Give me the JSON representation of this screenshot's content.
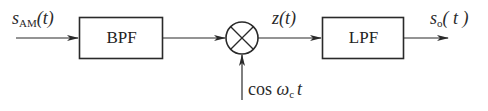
{
  "diagram": {
    "type": "block-diagram",
    "input": {
      "symbol": "s",
      "subscript": "AM",
      "arg": "(t)"
    },
    "blocks": [
      {
        "id": "bpf",
        "label": "BPF"
      },
      {
        "id": "mixer",
        "label": "multiplier"
      },
      {
        "id": "lpf",
        "label": "LPF"
      }
    ],
    "intermediate": {
      "symbol": "z",
      "arg": "(t)"
    },
    "carrier": {
      "prefix": "cos ",
      "symbol": "ω",
      "subscript": "c",
      "suffix": "t"
    },
    "output": {
      "symbol": "s",
      "subscript": "o",
      "arg": "( t )"
    },
    "colors": {
      "stroke": "#2a2a2a",
      "background": "#ffffff"
    }
  }
}
